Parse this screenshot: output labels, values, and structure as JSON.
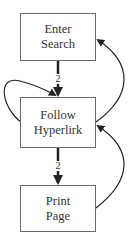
{
  "diagram": {
    "nodes": [
      {
        "id": "enter-search",
        "line1": "Enter",
        "line2": "Search"
      },
      {
        "id": "follow-hyperlink",
        "line1": "Follow",
        "line2": "Hyperlirk"
      },
      {
        "id": "print-page",
        "line1": "Print",
        "line2": "Page"
      }
    ],
    "edges": [
      {
        "from": "enter-search",
        "to": "follow-hyperlink",
        "label": "2",
        "style": "thick"
      },
      {
        "from": "follow-hyperlink",
        "to": "print-page",
        "label": "2",
        "style": "thick"
      },
      {
        "from": "follow-hyperlink",
        "to": "follow-hyperlink",
        "label": "",
        "style": "thin-self-loop"
      },
      {
        "from": "follow-hyperlink",
        "to": "enter-search",
        "label": "",
        "style": "thin-curved"
      },
      {
        "from": "print-page",
        "to": "follow-hyperlink",
        "label": "",
        "style": "thin-curved"
      }
    ]
  },
  "colors": {
    "stroke": "#222222",
    "box_border": "#6a6a6a",
    "text": "#333333",
    "background": "#ffffff"
  }
}
